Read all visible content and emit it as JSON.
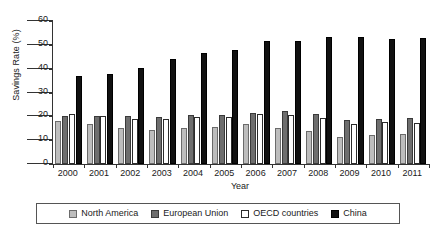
{
  "chart_data": {
    "type": "bar",
    "title": "",
    "xlabel": "Year",
    "ylabel": "Savings Rate (%)",
    "ylim": [
      0,
      60
    ],
    "yticks": [
      0,
      10,
      20,
      30,
      40,
      50,
      60
    ],
    "grid": false,
    "legend_position": "bottom",
    "categories": [
      "2000",
      "2001",
      "2002",
      "2003",
      "2004",
      "2005",
      "2006",
      "2007",
      "2008",
      "2009",
      "2010",
      "2011"
    ],
    "series": [
      {
        "name": "North America",
        "color": "#bdbdbd",
        "values": [
          18.0,
          16.6,
          15.0,
          14.2,
          15.0,
          15.4,
          16.6,
          15.0,
          13.7,
          11.3,
          12.2,
          12.4
        ]
      },
      {
        "name": "European Union",
        "color": "#6e6e6e",
        "values": [
          20.2,
          20.0,
          20.1,
          19.6,
          20.7,
          20.4,
          21.3,
          22.2,
          21.1,
          18.6,
          18.9,
          19.4
        ]
      },
      {
        "name": "OECD countries",
        "color": "#ffffff",
        "values": [
          21.1,
          20.1,
          18.9,
          18.9,
          19.6,
          19.9,
          20.9,
          20.5,
          19.3,
          16.9,
          17.5,
          17.4
        ]
      },
      {
        "name": "China",
        "color": "#111111",
        "values": [
          36.8,
          37.6,
          40.4,
          43.9,
          46.7,
          48.0,
          51.5,
          51.8,
          53.1,
          53.4,
          52.3,
          52.7
        ]
      }
    ]
  }
}
